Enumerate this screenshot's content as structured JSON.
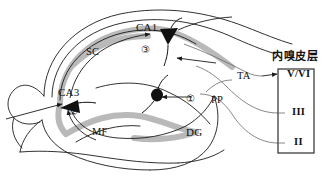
{
  "figure": {
    "background_color": "#ffffff",
    "outline_color": "#1a1a1a",
    "cell_layer_color": "#b9b9b9",
    "neuron_fill_color": "#111111",
    "connector_color": "#555555"
  },
  "regions": [
    {
      "id": "ca1",
      "label": "CA1"
    },
    {
      "id": "ca3",
      "label": "CA3"
    },
    {
      "id": "dg",
      "label": "DG"
    }
  ],
  "pathways": [
    {
      "id": "sc",
      "label": "SC"
    },
    {
      "id": "mf",
      "label": "MF"
    },
    {
      "id": "pp",
      "label": "PP"
    },
    {
      "id": "ta",
      "label": "TA"
    }
  ],
  "steps": [
    {
      "id": "step-1",
      "label": "①"
    },
    {
      "id": "step-2",
      "label": "②"
    },
    {
      "id": "step-3",
      "label": "③"
    }
  ],
  "entorhinal_cortex": {
    "title": "内嗅皮层",
    "layers": [
      {
        "id": "layer-v-vi",
        "label": "V/VI"
      },
      {
        "id": "layer-iii",
        "label": "III"
      },
      {
        "id": "layer-ii",
        "label": "II"
      }
    ]
  }
}
